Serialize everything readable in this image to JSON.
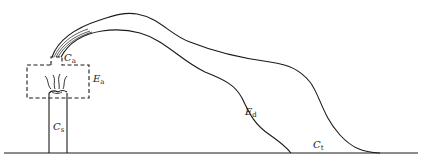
{
  "diagram": {
    "type": "plume-dispersion-schematic",
    "stroke_color": "#1a1a1a",
    "labels": {
      "c_a": {
        "main": "C",
        "sub": "a"
      },
      "e_a": {
        "main": "E",
        "sub": "a"
      },
      "c_s": {
        "main": "C",
        "sub": "s"
      },
      "e_d": {
        "main": "E",
        "sub": "d"
      },
      "c_t": {
        "main": "C",
        "sub": "t"
      }
    },
    "elements": {
      "stack": "smokestack",
      "emission_box": "dashed enclosure around stack top",
      "plume_upper": "upper plume boundary",
      "plume_lower": "lower plume boundary",
      "ground": "ground line"
    }
  }
}
